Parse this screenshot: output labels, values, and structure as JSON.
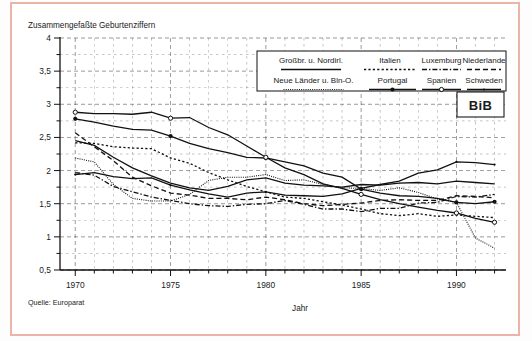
{
  "figure": {
    "y_axis_title": "Zusammengefaßte Geburtenziffern",
    "x_axis_title": "Jahr",
    "source": "Quelle: Europarat",
    "stamp": "BiB"
  },
  "chart_data": {
    "type": "line",
    "title": "Zusammengefaßte Geburtenziffern",
    "xlabel": "Jahr",
    "ylabel": "Zusammengefaßte Geburtenziffern",
    "xlim": [
      1969.2,
      1992.6
    ],
    "ylim": [
      0.5,
      4
    ],
    "y_ticks": [
      "0,5",
      "1",
      "1,5",
      "2",
      "2,5",
      "3",
      "3,5",
      "4"
    ],
    "y_tick_values": [
      0.5,
      1,
      1.5,
      2,
      2.5,
      3,
      3.5,
      4
    ],
    "y_minor_step": 0.25,
    "x_ticks": [
      "1970",
      "1975",
      "1980",
      "1985",
      "1990"
    ],
    "x_tick_values": [
      1970,
      1975,
      1980,
      1985,
      1990
    ],
    "x_minor_step": 1,
    "grid": "dashed-both",
    "legend_position": "top-right-inside",
    "annotation": "BiB",
    "source": "Quelle: Europarat",
    "x": [
      1970,
      1971,
      1972,
      1973,
      1974,
      1975,
      1976,
      1977,
      1978,
      1979,
      1980,
      1981,
      1982,
      1983,
      1984,
      1985,
      1986,
      1987,
      1988,
      1989,
      1990,
      1991,
      1992
    ],
    "series": [
      {
        "name": "Großbr. u. Nordirl.",
        "style": "solid",
        "marker": "none",
        "values": [
          2.45,
          2.38,
          2.2,
          2.04,
          1.92,
          1.81,
          1.74,
          1.7,
          1.76,
          1.86,
          1.89,
          1.81,
          1.78,
          1.77,
          1.75,
          1.79,
          1.78,
          1.81,
          1.82,
          1.8,
          1.84,
          1.82,
          1.8
        ]
      },
      {
        "name": "Italien",
        "style": "dotted",
        "marker": "none",
        "values": [
          2.42,
          2.41,
          2.36,
          2.34,
          2.33,
          2.19,
          2.11,
          1.97,
          1.86,
          1.76,
          1.68,
          1.6,
          1.58,
          1.53,
          1.48,
          1.42,
          1.35,
          1.32,
          1.35,
          1.31,
          1.33,
          1.31,
          1.29
        ]
      },
      {
        "name": "Luxemburg",
        "style": "dash-dot",
        "marker": "none",
        "values": [
          1.97,
          1.93,
          1.76,
          1.68,
          1.6,
          1.55,
          1.5,
          1.47,
          1.46,
          1.49,
          1.5,
          1.55,
          1.49,
          1.42,
          1.42,
          1.38,
          1.43,
          1.43,
          1.51,
          1.52,
          1.61,
          1.6,
          1.64
        ]
      },
      {
        "name": "Niederlande",
        "style": "dashed",
        "marker": "none",
        "values": [
          2.57,
          2.36,
          2.15,
          1.9,
          1.77,
          1.66,
          1.63,
          1.58,
          1.58,
          1.56,
          1.6,
          1.56,
          1.5,
          1.47,
          1.49,
          1.51,
          1.55,
          1.56,
          1.55,
          1.55,
          1.62,
          1.61,
          1.59
        ]
      },
      {
        "name": "Neue Länder u. Bln-O.",
        "style": "fine-dotted",
        "marker": "none",
        "values": [
          2.19,
          2.13,
          1.79,
          1.58,
          1.54,
          1.54,
          1.64,
          1.85,
          1.9,
          1.9,
          1.94,
          1.85,
          1.86,
          1.79,
          1.74,
          1.73,
          1.7,
          1.74,
          1.67,
          1.57,
          1.52,
          0.98,
          0.83
        ]
      },
      {
        "name": "Portugal",
        "style": "solid",
        "marker": "filled-circle",
        "values": [
          2.78,
          2.73,
          2.67,
          2.62,
          2.61,
          2.52,
          2.41,
          2.33,
          2.27,
          2.2,
          2.19,
          2.13,
          2.07,
          1.96,
          1.9,
          1.72,
          1.66,
          1.62,
          1.61,
          1.58,
          1.52,
          1.5,
          1.53
        ]
      },
      {
        "name": "Spanien",
        "style": "solid",
        "marker": "open-circle",
        "values": [
          2.88,
          2.86,
          2.86,
          2.85,
          2.88,
          2.79,
          2.8,
          2.65,
          2.54,
          2.37,
          2.2,
          2.04,
          1.94,
          1.8,
          1.73,
          1.64,
          1.56,
          1.5,
          1.45,
          1.4,
          1.36,
          1.28,
          1.22
        ]
      },
      {
        "name": "Schweden",
        "style": "solid",
        "marker": "small-dot",
        "values": [
          1.94,
          1.97,
          1.91,
          1.88,
          1.89,
          1.78,
          1.71,
          1.65,
          1.6,
          1.66,
          1.68,
          1.63,
          1.62,
          1.61,
          1.65,
          1.73,
          1.79,
          1.84,
          1.96,
          2.01,
          2.13,
          2.12,
          2.09
        ]
      }
    ]
  },
  "legend": {
    "rows": [
      [
        {
          "label": "Großbr. u. Nordirl.",
          "style": "solid",
          "marker": "none"
        },
        {
          "label": "Italien",
          "style": "dotted",
          "marker": "none"
        },
        {
          "label": "Luxemburg",
          "style": "dash-dot",
          "marker": "none"
        },
        {
          "label": "Niederlande",
          "style": "dashed",
          "marker": "none"
        }
      ],
      [
        {
          "label": "Neue Länder u. Bln-O.",
          "style": "fine-dotted",
          "marker": "none"
        },
        {
          "label": "Portugal",
          "style": "solid",
          "marker": "filled-circle"
        },
        {
          "label": "Spanien",
          "style": "solid",
          "marker": "open-circle"
        },
        {
          "label": "Schweden",
          "style": "solid",
          "marker": "small-dot"
        }
      ]
    ]
  }
}
